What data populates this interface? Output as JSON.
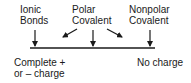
{
  "diagram": {
    "top_labels": [
      {
        "line1": "Ionic",
        "line2": "Bonds"
      },
      {
        "line1": "Polar",
        "line2": "Covalent"
      },
      {
        "line1": "Nonpolar",
        "line2": "Covalent"
      }
    ],
    "bottom_labels": {
      "left": {
        "line1": "Complete +",
        "line2": "or – charge"
      },
      "right": {
        "line1": "No charge"
      }
    },
    "colors": {
      "ink": "#1a1a1a",
      "background": "#ffffff"
    }
  }
}
